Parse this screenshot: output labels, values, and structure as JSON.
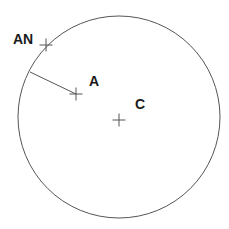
{
  "figure": {
    "background_color": "#ffffff",
    "stroke_color": "#555555",
    "label_color": "#1a1a1a",
    "width": 229,
    "height": 229
  },
  "chart_data": {
    "type": "scatter",
    "title": "",
    "xlabel": "",
    "ylabel": "",
    "xlim": [
      0,
      229
    ],
    "ylim": [
      0,
      229
    ],
    "grid": false,
    "legend": null,
    "shapes": [
      {
        "name": "circle",
        "kind": "circle",
        "cx": 119,
        "cy": 117,
        "r": 101,
        "stroke": "#555555",
        "stroke_width": 1,
        "fill": "none"
      },
      {
        "name": "radius-line-AN-to-A",
        "kind": "line",
        "x1": 30,
        "y1": 72,
        "x2": 76,
        "y2": 94,
        "stroke": "#555555",
        "stroke_width": 1
      }
    ],
    "points": [
      {
        "label": "AN",
        "x": 46,
        "y": 45,
        "marker": "cross",
        "marker_size": 13,
        "label_dx": -33,
        "label_dy": -1,
        "label_anchor": "start",
        "on_circle": true
      },
      {
        "label": "A",
        "x": 76,
        "y": 94,
        "marker": "cross",
        "marker_size": 13,
        "label_dx": 13,
        "label_dy": -8,
        "label_anchor": "start",
        "on_circle": false
      },
      {
        "label": "C",
        "x": 119,
        "y": 120,
        "marker": "cross",
        "marker_size": 13,
        "label_dx": 16,
        "label_dy": -11,
        "label_anchor": "start",
        "on_circle": false
      }
    ],
    "label_font_size": 14
  }
}
